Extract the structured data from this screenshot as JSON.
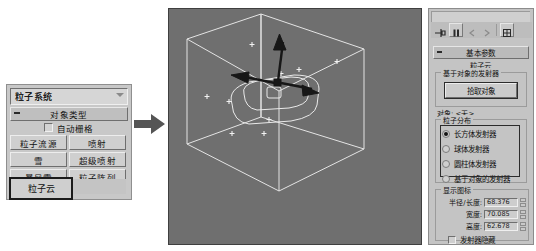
{
  "left_panel": {
    "category_combo": {
      "value": "粒子系统",
      "icon": "chevron-down-icon"
    },
    "rollout_title": "对象类型",
    "autogrid": {
      "label": "自动栅格",
      "checked": false
    },
    "buttons": [
      [
        "粒子流源",
        "喷射"
      ],
      [
        "雪",
        "超级喷射"
      ],
      [
        "暴风雪",
        "粒子阵列"
      ]
    ],
    "selected_button": "粒子云"
  },
  "arrow": {
    "name": "flow-arrow-right"
  },
  "viewport": {
    "background_color": "#6f6f6f",
    "wire_color": "#e8e8e8",
    "gizmo_color": "#1c1c1c",
    "particles": 9
  },
  "right_panel": {
    "toolbar_icons": [
      "pin-stack-icon",
      "pause-icon",
      "prev-icon",
      "next-icon",
      "config-icon"
    ],
    "basic_rollout": "基本参数",
    "object_name": "粒子云",
    "emitter_group": {
      "label": "基于对象的发射器",
      "pick_button": "拾取对象",
      "object_label": "对象: <无>"
    },
    "distribution_group": {
      "label": "粒子分布",
      "options": [
        {
          "label": "长方体发射器",
          "selected": true
        },
        {
          "label": "球体发射器",
          "selected": false
        },
        {
          "label": "圆柱体发射器",
          "selected": false
        },
        {
          "label": "基于对象的发射器",
          "selected": false
        }
      ]
    },
    "display_group": {
      "label": "显示图标",
      "fields": [
        {
          "label": "半径/长度:",
          "value": "68.376"
        },
        {
          "label": "宽度:",
          "value": "70.085"
        },
        {
          "label": "高度:",
          "value": "62.678"
        }
      ],
      "hide_checkbox": {
        "label": "发射器隐藏",
        "checked": false
      }
    }
  }
}
